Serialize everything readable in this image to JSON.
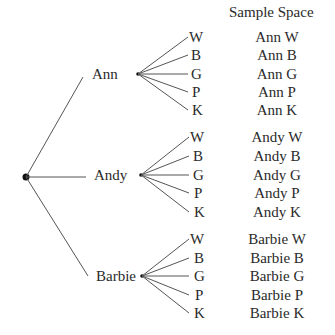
{
  "header": {
    "sample_space_title": "Sample Space"
  },
  "root": {
    "label": ""
  },
  "people": [
    {
      "name": "Ann",
      "choices": [
        "W",
        "B",
        "G",
        "P",
        "K"
      ],
      "outcomes": [
        "Ann W",
        "Ann B",
        "Ann G",
        "Ann P",
        "Ann K"
      ]
    },
    {
      "name": "Andy",
      "choices": [
        "W",
        "B",
        "G",
        "P",
        "K"
      ],
      "outcomes": [
        "Andy W",
        "Andy B",
        "Andy G",
        "Andy P",
        "Andy K"
      ]
    },
    {
      "name": "Barbie",
      "choices": [
        "W",
        "B",
        "G",
        "P",
        "K"
      ],
      "outcomes": [
        "Barbie W",
        "Barbie B",
        "Barbie G",
        "Barbie P",
        "Barbie K"
      ]
    }
  ],
  "colors": {
    "line": "#555555",
    "text": "#2a2a2a",
    "dot": "#111111"
  }
}
